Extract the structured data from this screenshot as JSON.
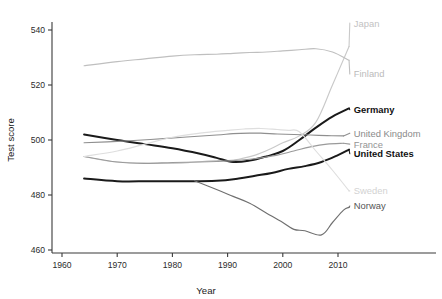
{
  "chart_data": {
    "type": "line",
    "title": "",
    "xlabel": "Year",
    "ylabel": "Test score",
    "xlim": [
      1960,
      2014
    ],
    "ylim": [
      458,
      546
    ],
    "xticks": [
      1960,
      1970,
      1980,
      1990,
      2000,
      2010
    ],
    "yticks": [
      460,
      480,
      500,
      520,
      540
    ],
    "grid": false,
    "legend_position": "right-of-line-end",
    "series": [
      {
        "name": "Japan",
        "color": "#c9c9c9",
        "width": 1.15,
        "bold_label": false,
        "label_color": "#c2c2c2",
        "label_x": 2012.5,
        "label_y": 542.5,
        "x": [
          1964,
          1970,
          1980,
          1984,
          1988,
          1990,
          1992,
          1995,
          1998,
          2000,
          2003,
          2006,
          2009,
          2012
        ],
        "y": [
          494.0,
          492.0,
          491.5,
          492.0,
          492.5,
          492.5,
          493.0,
          494.5,
          497.0,
          499.0,
          501.5,
          506.5,
          520.0,
          534.0
        ]
      },
      {
        "name": "Finland",
        "color": "#bfbfbf",
        "width": 1.15,
        "bold_label": false,
        "label_color": "#bbbbbb",
        "label_x": 2012.5,
        "label_y": 524.0,
        "x": [
          1964,
          1970,
          1975,
          1980,
          1984,
          1988,
          1991,
          1994,
          1997,
          2000,
          2003,
          2006,
          2009,
          2012
        ],
        "y": [
          527.0,
          528.5,
          529.5,
          530.5,
          531.0,
          531.2,
          531.5,
          531.8,
          532.0,
          532.4,
          532.8,
          533.2,
          532.0,
          529.0
        ]
      },
      {
        "name": "Germany",
        "color": "#1a1a1a",
        "width": 2.0,
        "bold_label": true,
        "label_color": "#111111",
        "label_x": 2012.5,
        "label_y": 511.0,
        "x": [
          1964,
          1970,
          1975,
          1980,
          1985,
          1988,
          1991,
          1994,
          1997,
          2000,
          2003,
          2006,
          2009,
          2012
        ],
        "y": [
          502.0,
          500.0,
          498.5,
          497.0,
          495.0,
          493.5,
          492.0,
          492.5,
          494.0,
          496.0,
          500.0,
          504.5,
          508.5,
          511.5
        ]
      },
      {
        "name": "United Kingdom",
        "color": "#8f8f8f",
        "width": 1.15,
        "bold_label": false,
        "label_color": "#8a8a8a",
        "label_x": 2012.5,
        "label_y": 502.5,
        "x": [
          1964,
          1970,
          1976,
          1982,
          1988,
          1991,
          1994,
          1996,
          1999,
          2002,
          2005,
          2008,
          2011
        ],
        "y": [
          499.0,
          499.5,
          500.2,
          501.0,
          501.8,
          502.3,
          502.5,
          502.5,
          502.2,
          502.0,
          501.8,
          501.6,
          501.5
        ]
      },
      {
        "name": "France",
        "color": "#9a9a9a",
        "width": 1.15,
        "bold_label": false,
        "label_color": "#949494",
        "label_x": 2012.5,
        "label_y": 498.5,
        "x": [
          1964,
          1970,
          1975,
          1980,
          1985,
          1988,
          1991,
          1994,
          1996,
          1999,
          2002,
          2005,
          2008,
          2011
        ],
        "y": [
          494.0,
          492.0,
          491.5,
          491.8,
          492.0,
          492.2,
          492.5,
          493.0,
          493.5,
          494.5,
          496.0,
          497.5,
          498.5,
          498.8
        ]
      },
      {
        "name": "United States",
        "color": "#1a1a1a",
        "width": 2.0,
        "bold_label": true,
        "label_color": "#111111",
        "label_x": 2012.5,
        "label_y": 495.0,
        "x": [
          1964,
          1970,
          1976,
          1982,
          1988,
          1992,
          1995,
          1998,
          2001,
          2004,
          2007,
          2010,
          2012
        ],
        "y": [
          486.0,
          485.0,
          485.0,
          485.0,
          485.2,
          486.0,
          487.0,
          488.0,
          489.5,
          490.5,
          492.0,
          494.5,
          496.5
        ]
      },
      {
        "name": "Sweden",
        "color": "#dedede",
        "width": 1.15,
        "bold_label": false,
        "label_color": "#d2d2d2",
        "label_x": 2012.5,
        "label_y": 481.5,
        "x": [
          1964,
          1970,
          1975,
          1980,
          1985,
          1990,
          1993,
          1996,
          1999,
          2001,
          2003,
          2006,
          2009,
          2012
        ],
        "y": [
          494.0,
          496.0,
          498.5,
          501.0,
          502.5,
          503.5,
          504.0,
          504.2,
          503.8,
          503.5,
          503.0,
          496.0,
          489.0,
          481.5
        ]
      },
      {
        "name": "Norway",
        "color": "#6f6f6f",
        "width": 1.15,
        "bold_label": false,
        "label_color": "#555555",
        "label_x": 2012.5,
        "label_y": 476.0,
        "x": [
          1984,
          1988,
          1991,
          1994,
          1997,
          2000,
          2002,
          2004,
          2007,
          2009,
          2011,
          2012
        ],
        "y": [
          485.2,
          482.0,
          479.5,
          477.0,
          473.5,
          470.0,
          467.5,
          467.0,
          465.5,
          470.0,
          474.5,
          475.5
        ]
      }
    ]
  },
  "axes": {
    "y_title": "Test score",
    "x_title": "Year",
    "y_tick_labels": [
      "460",
      "480",
      "500",
      "520",
      "540"
    ],
    "x_tick_labels": [
      "1960",
      "1970",
      "1980",
      "1990",
      "2000",
      "2010"
    ]
  },
  "colors": {
    "axis": "#3a3a3a",
    "text": "#1a1a1a",
    "background": "#ffffff"
  }
}
